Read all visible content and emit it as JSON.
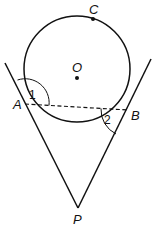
{
  "figure": {
    "stroke_color": "#111111",
    "background": "#ffffff"
  },
  "circle": {
    "center_label": "O",
    "center": [
      77,
      69
    ],
    "radius": 53
  },
  "points": {
    "A": {
      "label": "A",
      "x": 25,
      "y": 104
    },
    "B": {
      "label": "B",
      "x": 128,
      "y": 110
    },
    "C": {
      "label": "C",
      "x": 93,
      "y": 19
    },
    "O": {
      "label": "O",
      "x": 77,
      "y": 78
    },
    "P": {
      "label": "P",
      "x": 78,
      "y": 208
    }
  },
  "segments": [
    {
      "name": "tangent-PA",
      "from": "P",
      "to": "A",
      "extended": true,
      "style": "solid"
    },
    {
      "name": "tangent-PB",
      "from": "P",
      "to": "B",
      "extended": true,
      "style": "solid"
    },
    {
      "name": "chord-AB",
      "from": "A",
      "to": "B",
      "style": "dashed"
    }
  ],
  "angles": [
    {
      "label": "1",
      "vertex": "A",
      "between": [
        "tangent extension above A",
        "chord AB"
      ]
    },
    {
      "label": "2",
      "vertex": "B",
      "between": [
        "chord BA",
        "tangent BP"
      ]
    }
  ]
}
